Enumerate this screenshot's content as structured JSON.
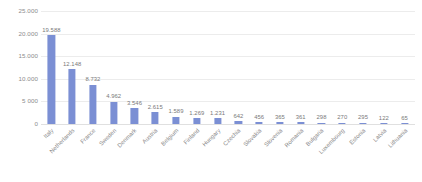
{
  "chart_data": {
    "type": "bar",
    "title": "",
    "subtitle": "",
    "xlabel": "",
    "ylabel": "",
    "ylim": [
      0,
      25000
    ],
    "grid": true,
    "legend": false,
    "legend_position": "none",
    "bar_color": "#7b8fd4",
    "axis_text_color": "#8a8a8a",
    "gridline_color": "#ececec",
    "decimal_separator": ".",
    "y_ticks": [
      {
        "value": 25000,
        "label": "25.000"
      },
      {
        "value": 20000,
        "label": "20.000"
      },
      {
        "value": 15000,
        "label": "15.000"
      },
      {
        "value": 10000,
        "label": "10.000"
      },
      {
        "value": 5000,
        "label": "5 000"
      },
      {
        "value": 0,
        "label": "0"
      }
    ],
    "categories": [
      "Italy",
      "Netherlands",
      "France",
      "Sweden",
      "Denmark",
      "Austria",
      "Belgium",
      "Finland",
      "Hungary",
      "Czechia",
      "Slovakia",
      "Slovenia",
      "Romania",
      "Bulgaria",
      "Luxembourg",
      "Estonia",
      "Latvia",
      "Lithuania"
    ],
    "values": [
      19588,
      12148,
      8732,
      4962,
      3546,
      2615,
      1589,
      1269,
      1231,
      642,
      456,
      365,
      361,
      298,
      270,
      295,
      122,
      65
    ],
    "value_labels": [
      "19.588",
      "12.148",
      "8.732",
      "4.962",
      "3.546",
      "2.615",
      "1.589",
      "1.269",
      "1.231",
      "642",
      "456",
      "365",
      "361",
      "298",
      "270",
      "295",
      "122",
      "65"
    ]
  }
}
